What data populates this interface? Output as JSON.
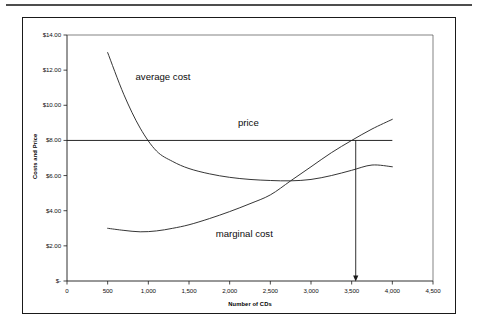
{
  "chart_data": {
    "type": "line",
    "title": "",
    "xlabel": "Number of CDs",
    "ylabel": "Costs and Price",
    "xlim": [
      0,
      4500
    ],
    "ylim": [
      0,
      14
    ],
    "grid": false,
    "legend_position": "inline-annotations",
    "x_ticks": [
      "0",
      "500",
      "1,000",
      "1,500",
      "2,000",
      "2,500",
      "3,000",
      "3,500",
      "4,000",
      "4,500"
    ],
    "x_tick_values": [
      0,
      500,
      1000,
      1500,
      2000,
      2500,
      3000,
      3500,
      4000,
      4500
    ],
    "y_ticks": [
      "$-",
      "$2.00",
      "$4.00",
      "$6.00",
      "$8.00",
      "$10.00",
      "$12.00",
      "$14.00"
    ],
    "y_tick_values": [
      0,
      2,
      4,
      6,
      8,
      10,
      12,
      14
    ],
    "series": [
      {
        "name": "average cost",
        "label_text": "average cost",
        "x": [
          500,
          700,
          900,
          1100,
          1300,
          1500,
          1750,
          2000,
          2250,
          2500,
          2750,
          3000,
          3250,
          3500,
          3750,
          4000
        ],
        "values": [
          13.0,
          10.6,
          8.7,
          7.4,
          6.8,
          6.4,
          6.1,
          5.9,
          5.78,
          5.72,
          5.7,
          5.78,
          6.0,
          6.3,
          6.6,
          6.5
        ]
      },
      {
        "name": "marginal cost",
        "label_text": "marginal cost",
        "x": [
          500,
          700,
          900,
          1100,
          1300,
          1500,
          1750,
          2000,
          2250,
          2500,
          2750,
          3000,
          3250,
          3500,
          3750,
          4000
        ],
        "values": [
          3.0,
          2.88,
          2.8,
          2.85,
          3.0,
          3.2,
          3.55,
          3.95,
          4.4,
          4.9,
          5.7,
          6.5,
          7.3,
          8.0,
          8.65,
          9.2
        ]
      },
      {
        "name": "price",
        "label_text": "price",
        "x": [
          0,
          4000
        ],
        "values": [
          8.0,
          8.0
        ]
      }
    ],
    "annotations": [
      {
        "name": "equilibrium-arrow",
        "x": 3550,
        "from_y": 8.0,
        "to_y": 0.0,
        "style": "down-arrow"
      }
    ]
  }
}
